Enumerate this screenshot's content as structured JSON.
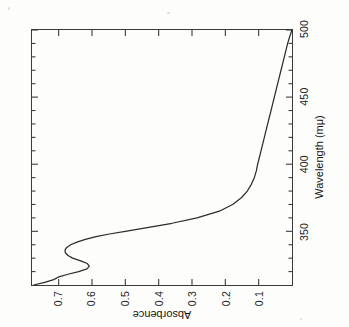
{
  "figure": {
    "background_color": "#fdfdfc",
    "line_color": "#2b2b2b",
    "axis_color": "#3a3a3a",
    "orientation_note": "rotated-90-ccw"
  },
  "chart_data": {
    "type": "line",
    "title": "",
    "subtitle": "",
    "xlabel": "Wavelength (mμ)",
    "ylabel": "Absorbence",
    "xlim": [
      310,
      500
    ],
    "ylim": [
      0.0,
      0.78
    ],
    "xticks": [
      350,
      400,
      450,
      500
    ],
    "xtick_labels": [
      "350",
      "400",
      "450",
      "500"
    ],
    "yticks": [
      0.1,
      0.2,
      0.3,
      0.4,
      0.5,
      0.6,
      0.7
    ],
    "ytick_labels": [
      "0.1",
      "0.2",
      "0.3",
      "0.4",
      "0.5",
      "0.6",
      "0.7"
    ],
    "grid": false,
    "legend": null,
    "series": [
      {
        "name": "absorbance spectrum",
        "x": [
          310,
          312,
          314,
          316,
          318,
          320,
          322,
          324,
          326,
          328,
          330,
          332,
          334,
          336,
          338,
          340,
          342,
          344,
          346,
          348,
          350,
          353,
          356,
          360,
          365,
          370,
          375,
          380,
          385,
          390,
          395,
          400,
          405,
          410,
          415,
          420,
          425,
          430,
          435,
          440,
          445,
          450,
          455,
          460,
          465,
          470,
          475,
          480,
          485,
          490,
          495,
          500
        ],
        "y": [
          0.775,
          0.742,
          0.715,
          0.7,
          0.672,
          0.64,
          0.615,
          0.608,
          0.614,
          0.634,
          0.658,
          0.672,
          0.68,
          0.681,
          0.676,
          0.664,
          0.645,
          0.62,
          0.588,
          0.548,
          0.5,
          0.43,
          0.36,
          0.285,
          0.218,
          0.178,
          0.152,
          0.134,
          0.122,
          0.113,
          0.107,
          0.103,
          0.098,
          0.093,
          0.088,
          0.083,
          0.078,
          0.073,
          0.068,
          0.063,
          0.058,
          0.053,
          0.048,
          0.043,
          0.038,
          0.033,
          0.028,
          0.023,
          0.018,
          0.013,
          0.007,
          0.0
        ]
      }
    ],
    "annotations": []
  },
  "axes": {
    "x_title": "Wavelength (mμ)",
    "y_title": "Absorbence"
  }
}
